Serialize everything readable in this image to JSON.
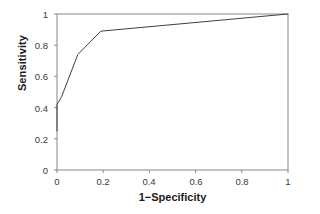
{
  "chart_data": {
    "type": "line",
    "title": "",
    "subtitle": "",
    "xlabel": "1−Specificity",
    "ylabel": "Sensitivity",
    "xlim": [
      0,
      1
    ],
    "ylim": [
      0,
      1
    ],
    "grid": false,
    "legend": "none",
    "x_ticks": [
      "0",
      "0.2",
      "0.4",
      "0.6",
      "0.8",
      "1"
    ],
    "x_tick_values": [
      0,
      0.2,
      0.4,
      0.6,
      0.8,
      1
    ],
    "y_ticks": [
      "0",
      "0.2",
      "0.4",
      "0.6",
      "0.8",
      "1"
    ],
    "y_tick_values": [
      0,
      0.2,
      0.4,
      0.6,
      0.8,
      1
    ],
    "series": [
      {
        "name": "ROC curve",
        "color": "#3f3f3f",
        "x": [
          0,
          0,
          0.02,
          0.09,
          0.19,
          1
        ],
        "y": [
          0.25,
          0.42,
          0.47,
          0.74,
          0.89,
          1
        ]
      }
    ]
  },
  "style": {
    "axis_color": "#8a8a8a",
    "curve_color": "#3f3f3f",
    "text_color": "#1a1a1a",
    "tick_text_color": "#3a3a3a",
    "background": "#ffffff"
  }
}
